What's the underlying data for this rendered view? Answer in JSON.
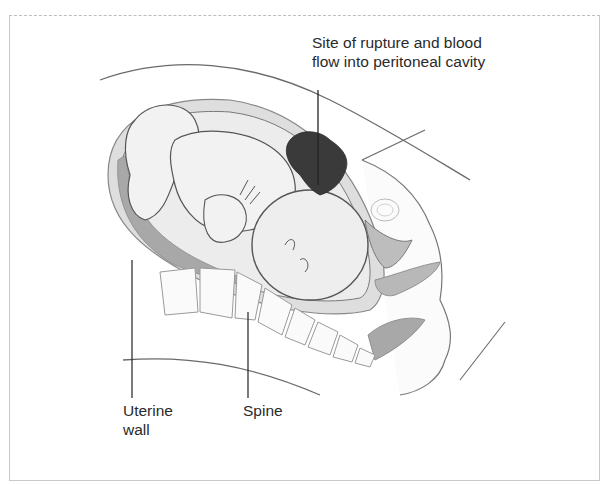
{
  "figure": {
    "caption_fragment": "g                                              ",
    "labels": {
      "rupture_line1": "Site of rupture and blood",
      "rupture_line2": "flow into peritoneal cavity",
      "uterine_line1": "Uterine",
      "uterine_line2": "wall",
      "spine": "Spine"
    },
    "colors": {
      "outline": "#5a5a5a",
      "uterine_wall": "#dcdcdc",
      "placenta": "#a9a9a9",
      "fetus_fill": "#eeeeee",
      "blood": "#3a3a3a",
      "frame": "#c9c9c9"
    }
  }
}
